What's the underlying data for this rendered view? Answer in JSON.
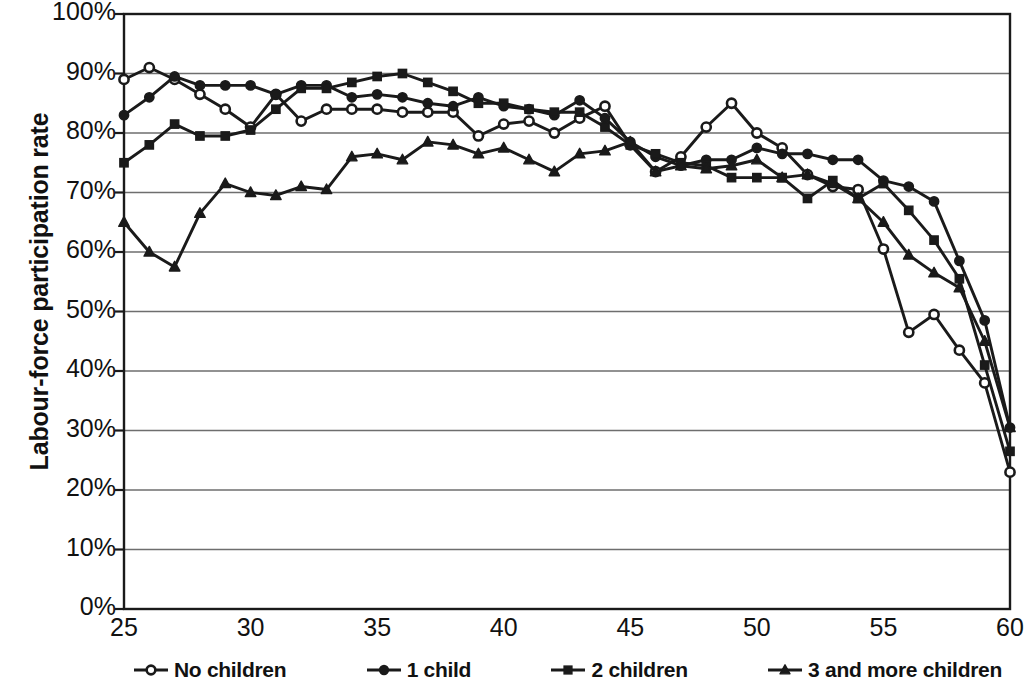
{
  "chart_data": {
    "type": "line",
    "title": "",
    "xlabel": "",
    "ylabel": "Labour-force participation rate",
    "xlim": [
      25,
      60
    ],
    "ylim": [
      0,
      1.0
    ],
    "grid": true,
    "legend_position": "bottom",
    "x_tick_labels": [
      "25",
      "30",
      "35",
      "40",
      "45",
      "50",
      "55",
      "60"
    ],
    "x_ticks": [
      25,
      30,
      35,
      40,
      45,
      50,
      55,
      60
    ],
    "y_tick_labels": [
      "0%",
      "10%",
      "20%",
      "30%",
      "40%",
      "50%",
      "60%",
      "70%",
      "80%",
      "90%",
      "100%"
    ],
    "y_ticks": [
      0,
      10,
      20,
      30,
      40,
      50,
      60,
      70,
      80,
      90,
      100
    ],
    "x": [
      25,
      26,
      27,
      28,
      29,
      30,
      31,
      32,
      33,
      34,
      35,
      36,
      37,
      38,
      39,
      40,
      41,
      42,
      43,
      44,
      45,
      46,
      47,
      48,
      49,
      50,
      51,
      52,
      53,
      54,
      55,
      56,
      57,
      58,
      59,
      60
    ],
    "series": [
      {
        "name": "No children",
        "marker": "open-circle",
        "values": [
          89.0,
          91.0,
          89.0,
          86.5,
          84.0,
          81.0,
          86.5,
          82.0,
          84.0,
          84.0,
          84.0,
          83.5,
          83.5,
          83.5,
          79.5,
          81.5,
          82.0,
          80.0,
          82.5,
          84.5,
          78.0,
          73.5,
          76.0,
          81.0,
          85.0,
          80.0,
          77.5,
          73.0,
          71.0,
          70.5,
          60.5,
          46.5,
          49.5,
          43.5,
          38.0,
          23.0
        ]
      },
      {
        "name": "1 child",
        "marker": "filled-circle",
        "values": [
          83.0,
          86.0,
          89.5,
          88.0,
          88.0,
          88.0,
          86.5,
          88.0,
          88.0,
          86.0,
          86.5,
          86.0,
          85.0,
          84.5,
          86.0,
          84.5,
          84.0,
          83.0,
          85.5,
          82.5,
          78.5,
          76.0,
          74.5,
          75.5,
          75.5,
          77.5,
          76.5,
          76.5,
          75.5,
          75.5,
          72.0,
          71.0,
          68.5,
          58.5,
          48.5,
          30.5
        ]
      },
      {
        "name": "2 children",
        "marker": "filled-square",
        "values": [
          75.0,
          78.0,
          81.5,
          79.5,
          79.5,
          80.5,
          84.0,
          87.5,
          87.5,
          88.5,
          89.5,
          90.0,
          88.5,
          87.0,
          85.0,
          85.0,
          84.0,
          83.5,
          83.5,
          81.0,
          78.0,
          76.5,
          75.0,
          74.5,
          72.5,
          72.5,
          72.5,
          69.0,
          72.0,
          69.0,
          71.5,
          67.0,
          62.0,
          55.5,
          41.0,
          26.5
        ]
      },
      {
        "name": "3 and more children",
        "marker": "filled-triangle",
        "values": [
          65.0,
          60.0,
          57.5,
          66.5,
          71.5,
          70.0,
          69.5,
          71.0,
          70.5,
          76.0,
          76.5,
          75.5,
          78.5,
          78.0,
          76.5,
          77.5,
          75.5,
          73.5,
          76.5,
          77.0,
          78.5,
          73.5,
          74.5,
          74.0,
          74.5,
          75.5,
          72.5,
          73.0,
          71.5,
          69.0,
          65.0,
          59.5,
          56.5,
          54.0,
          45.0,
          30.5
        ]
      }
    ]
  },
  "legend": {
    "items": [
      {
        "label": "No children",
        "marker": "open-circle"
      },
      {
        "label": "1 child",
        "marker": "filled-circle"
      },
      {
        "label": "2 children",
        "marker": "filled-square"
      },
      {
        "label": "3 and more children",
        "marker": "filled-triangle"
      }
    ]
  },
  "colors": {
    "line": "#1a1a1a",
    "grid": "#6e6e6e",
    "axis": "#1a1a1a",
    "background": "#ffffff",
    "text": "#111111"
  }
}
